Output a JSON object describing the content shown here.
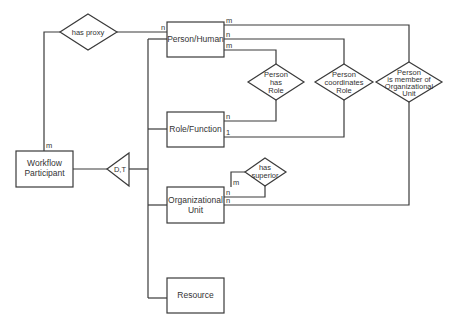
{
  "diagram": {
    "type": "entity-relationship",
    "entities": {
      "person_human": "Person/Human",
      "role_function": "Role/Function",
      "workflow_participant": [
        "Workflow",
        "Participant"
      ],
      "organizational_unit": [
        "Organizational",
        "Unit"
      ],
      "resource": "Resource"
    },
    "relationships": {
      "has_proxy": "has proxy",
      "person_has_role": [
        "Person",
        "has",
        "Role"
      ],
      "person_coordinates_role": [
        "Person",
        "coordinates",
        "Role"
      ],
      "person_member_org": [
        "Person",
        "is member of",
        "Organizational",
        "Unit"
      ],
      "has_superior": [
        "has",
        "superior"
      ]
    },
    "specialization": "D,T",
    "cardinalities": {
      "proxy_person": "n",
      "proxy_participant": "m",
      "person_member": "m",
      "person_coordinates": "n",
      "person_has_role": "m",
      "role_has_role": "n",
      "role_coordinates": "1",
      "org_superior_m": "m",
      "org_superior_n": "n",
      "org_member": "n"
    }
  }
}
